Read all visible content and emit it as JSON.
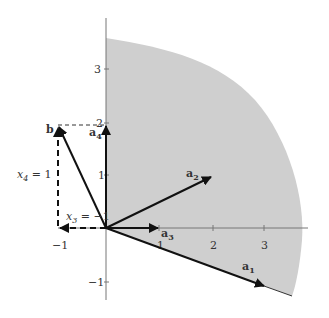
{
  "diagram": {
    "type": "vector-cone-diagram",
    "colors": {
      "cone_fill": "#cfcfcf",
      "axis": "#777777",
      "vector": "#111111",
      "text": "#333333"
    },
    "axes": {
      "x_ticks": [
        {
          "value": -1,
          "label": "−1"
        },
        {
          "value": 1,
          "label": "1"
        },
        {
          "value": 2,
          "label": "2"
        },
        {
          "value": 3,
          "label": "3"
        }
      ],
      "y_ticks": [
        {
          "value": -1,
          "label": "−1"
        },
        {
          "value": 1,
          "label": "1"
        },
        {
          "value": 2,
          "label": "2"
        },
        {
          "value": 3,
          "label": "3"
        }
      ]
    },
    "vectors": [
      {
        "name": "a1",
        "base": "a",
        "sub": "1",
        "coords": [
          3,
          -0.9
        ]
      },
      {
        "name": "a2",
        "base": "a",
        "sub": "2",
        "coords": [
          2,
          1
        ]
      },
      {
        "name": "a3",
        "base": "a",
        "sub": "3",
        "coords": [
          1,
          0
        ]
      },
      {
        "name": "a4",
        "base": "a",
        "sub": "4",
        "coords": [
          0,
          2
        ]
      },
      {
        "name": "b",
        "base": "b",
        "sub": "",
        "coords": [
          -1,
          2
        ]
      }
    ],
    "annotations": {
      "x4": {
        "var": "x",
        "sub": "4",
        "rest": " = 1"
      },
      "x3": {
        "var": "x",
        "sub": "3",
        "rest": " = −1"
      }
    }
  }
}
